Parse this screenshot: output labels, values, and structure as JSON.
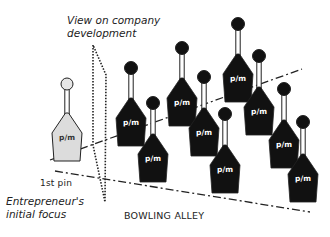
{
  "labels": {
    "view_line1": "View on company",
    "view_line2": "development",
    "first_pin": "1st pin",
    "focus_line1": "Entrepreneur's",
    "focus_line2": "initial focus",
    "alley": "BOWLING ALLEY"
  },
  "pin_label": "p/m",
  "colors": {
    "first_pin_fill": "#dcdcdc",
    "pin_fill": "#111111",
    "line": "#222222"
  },
  "pins": [
    {
      "id": "first",
      "cx": 67,
      "head_y": 84,
      "body_top": 113,
      "style": "light"
    },
    {
      "id": "a",
      "cx": 131,
      "head_y": 68,
      "body_top": 98,
      "style": "dark"
    },
    {
      "id": "b",
      "cx": 153,
      "head_y": 103,
      "body_top": 134,
      "style": "dark"
    },
    {
      "id": "c",
      "cx": 182,
      "head_y": 48,
      "body_top": 78,
      "style": "dark"
    },
    {
      "id": "d",
      "cx": 204,
      "head_y": 77,
      "body_top": 108,
      "style": "dark"
    },
    {
      "id": "e",
      "cx": 225,
      "head_y": 114,
      "body_top": 145,
      "style": "dark"
    },
    {
      "id": "f",
      "cx": 238,
      "head_y": 24,
      "body_top": 54,
      "style": "dark"
    },
    {
      "id": "g",
      "cx": 259,
      "head_y": 56,
      "body_top": 87,
      "style": "dark"
    },
    {
      "id": "h",
      "cx": 284,
      "head_y": 89,
      "body_top": 120,
      "style": "dark"
    },
    {
      "id": "i",
      "cx": 303,
      "head_y": 122,
      "body_top": 154,
      "style": "dark"
    }
  ]
}
